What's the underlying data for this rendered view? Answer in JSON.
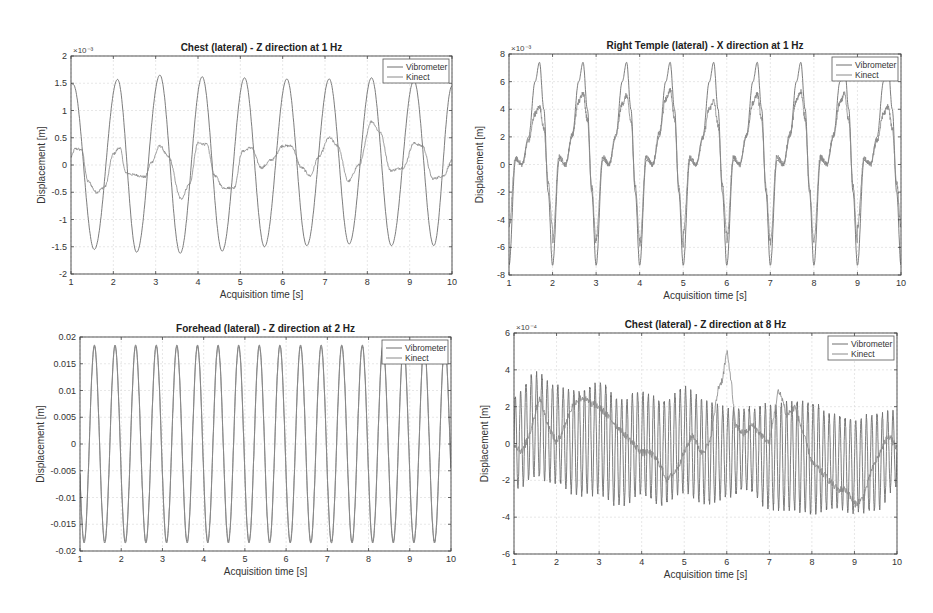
{
  "figure": {
    "background": "#ffffff",
    "axis_color": "#444444",
    "grid_color": "#d6d6d6",
    "series_colors": {
      "Vibrometer": "#6f6f6f",
      "Kinect": "#8a8a8a"
    }
  },
  "chart_data": [
    {
      "id": "chest-1hz",
      "type": "line",
      "title": "Chest (lateral) - Z direction at 1 Hz",
      "xlabel": "Acquisition time [s]",
      "ylabel": "Displacement [m]",
      "exponent_label": "×10⁻³",
      "xlim": [
        1,
        10
      ],
      "ylim": [
        -2,
        2
      ],
      "xticks": [
        "1",
        "2",
        "3",
        "4",
        "5",
        "6",
        "7",
        "8",
        "9",
        "10"
      ],
      "yticks": [
        "-2",
        "-1.5",
        "-1",
        "-0.5",
        "0",
        "0.5",
        "1",
        "1.5",
        "2"
      ],
      "ytick_values": [
        -2,
        -1.5,
        -1,
        -0.5,
        0,
        0.5,
        1,
        1.5,
        2
      ],
      "grid": true,
      "legend": {
        "position": "northeast",
        "entries": [
          "Vibrometer",
          "Kinect"
        ]
      },
      "box": {
        "left": 71,
        "top": 56,
        "right": 452,
        "bottom": 274
      },
      "series": [
        {
          "name": "Vibrometer",
          "description": "sinusoid ~1 Hz, amplitude ~1.55e-3",
          "x": [
            1.0,
            1.05,
            1.55,
            2.1,
            2.55,
            3.1,
            3.58,
            4.1,
            4.57,
            5.1,
            5.57,
            6.1,
            6.57,
            7.1,
            7.57,
            8.1,
            8.57,
            9.1,
            9.57,
            10.0
          ],
          "values": [
            1.5,
            1.48,
            -1.55,
            1.57,
            -1.6,
            1.65,
            -1.62,
            1.62,
            -1.58,
            1.6,
            -1.5,
            1.58,
            -1.48,
            1.58,
            -1.45,
            1.6,
            -1.48,
            1.55,
            -1.48,
            1.45
          ]
        },
        {
          "name": "Kinect",
          "description": "noisy low-amplitude signal ~±0.5e-3",
          "x": [
            1.0,
            1.1,
            1.25,
            1.4,
            1.6,
            1.8,
            2.0,
            2.15,
            2.3,
            2.5,
            2.75,
            2.9,
            3.1,
            3.3,
            3.6,
            3.8,
            4.0,
            4.2,
            4.4,
            4.6,
            4.85,
            5.05,
            5.25,
            5.5,
            5.75,
            6.0,
            6.2,
            6.45,
            6.65,
            6.85,
            7.1,
            7.3,
            7.55,
            7.8,
            8.1,
            8.3,
            8.55,
            8.85,
            9.1,
            9.3,
            9.55,
            9.8,
            10.0
          ],
          "values": [
            0.15,
            0.3,
            0.28,
            -0.3,
            -0.5,
            -0.4,
            0.2,
            0.32,
            -0.15,
            -0.18,
            -0.22,
            0.05,
            0.35,
            0.15,
            -0.62,
            -0.35,
            0.4,
            0.38,
            -0.2,
            -0.42,
            -0.42,
            0.25,
            0.32,
            -0.05,
            0.1,
            0.35,
            0.35,
            -0.05,
            -0.2,
            0.15,
            0.5,
            0.35,
            -0.3,
            0.0,
            0.8,
            0.6,
            -0.1,
            -0.05,
            0.4,
            0.35,
            -0.25,
            -0.2,
            0.08
          ]
        }
      ]
    },
    {
      "id": "temple-1hz",
      "type": "line",
      "title": "Right Temple (lateral) - X direction at 1 Hz",
      "xlabel": "Acquisition time [s]",
      "ylabel": "Displacement [m]",
      "exponent_label": "×10⁻³",
      "xlim": [
        1,
        10
      ],
      "ylim": [
        -8,
        8
      ],
      "xticks": [
        "1",
        "2",
        "3",
        "4",
        "5",
        "6",
        "7",
        "8",
        "9",
        "10"
      ],
      "yticks": [
        "-8",
        "-6",
        "-4",
        "-2",
        "0",
        "2",
        "4",
        "6",
        "8"
      ],
      "ytick_values": [
        -8,
        -6,
        -4,
        -2,
        0,
        2,
        4,
        6,
        8
      ],
      "grid": true,
      "legend": {
        "position": "northeast",
        "entries": [
          "Vibrometer",
          "Kinect"
        ]
      },
      "box": {
        "left": 509,
        "top": 54,
        "right": 901,
        "bottom": 275
      },
      "series": [
        {
          "name": "Vibrometer",
          "description": "periodic 1 Hz pulse, peaks ~7.5e-3, troughs ~-7.3e-3",
          "period_shape_x": [
            0.0,
            0.15,
            0.3,
            0.45,
            0.6,
            0.7,
            0.8,
            0.9,
            1.0
          ],
          "period_shape_y": [
            -7.3,
            0.3,
            0.0,
            2.0,
            6.0,
            7.4,
            4.0,
            -2.0,
            -7.3
          ],
          "cycle_starts": [
            1,
            2,
            3,
            4,
            5,
            6,
            7,
            8,
            9
          ],
          "values": [
            -7.3,
            7.4,
            -7.3,
            7.5,
            -7.3,
            7.5,
            -7.3,
            7.5,
            -7.2,
            7.5,
            -7.2,
            7.5,
            -7.2,
            7.5,
            -7.2,
            7.3,
            -7.0,
            7.0
          ]
        },
        {
          "name": "Kinect",
          "description": "tracks vibrometer with reduced amplitude, peaks ~4–5.3e-3, troughs ~-4 to -5.5e-3",
          "period_shape_x": [
            0.0,
            0.15,
            0.3,
            0.45,
            0.6,
            0.7,
            0.8,
            0.9,
            1.0
          ],
          "period_shape_y": [
            -5.2,
            0.5,
            0.0,
            2.0,
            4.2,
            4.8,
            3.0,
            -1.5,
            -5.2
          ],
          "cycle_starts": [
            1,
            2,
            3,
            4,
            5,
            6,
            7,
            8,
            9
          ],
          "values": [
            4.2,
            -5.4,
            5.2,
            -4.7,
            5.0,
            -5.3,
            5.4,
            -5.1,
            4.6,
            -5.3,
            5.1,
            -4.2,
            5.3,
            -4.5,
            5.1,
            -5.0
          ]
        }
      ]
    },
    {
      "id": "forehead-2hz",
      "type": "line",
      "title": "Forehead (lateral) - Z direction at 2 Hz",
      "xlabel": "Acquisition time [s]",
      "ylabel": "Displacement [m]",
      "exponent_label": "",
      "xlim": [
        1,
        10
      ],
      "ylim": [
        -0.02,
        0.02
      ],
      "xticks": [
        "1",
        "2",
        "3",
        "4",
        "5",
        "6",
        "7",
        "8",
        "9",
        "10"
      ],
      "yticks": [
        "-0.02",
        "-0.015",
        "-0.01",
        "-0.005",
        "0",
        "0.005",
        "0.01",
        "0.015",
        "0.02"
      ],
      "ytick_values": [
        -0.02,
        -0.015,
        -0.01,
        -0.005,
        0,
        0.005,
        0.01,
        0.015,
        0.02
      ],
      "grid": true,
      "legend": {
        "position": "northeast",
        "entries": [
          "Vibrometer",
          "Kinect"
        ]
      },
      "box": {
        "left": 80,
        "top": 337,
        "right": 451,
        "bottom": 551
      },
      "series": [
        {
          "name": "Vibrometer",
          "description": "sinusoid 2 Hz, amplitude ~0.0185; overlaps Kinect",
          "frequency_hz": 2,
          "amplitude": 0.0185,
          "phase_peak_at": 1.35
        },
        {
          "name": "Kinect",
          "description": "nearly identical to vibrometer",
          "frequency_hz": 2,
          "amplitude": 0.0182,
          "phase_peak_at": 1.35
        }
      ]
    },
    {
      "id": "chest-8hz",
      "type": "line",
      "title": "Chest (lateral) - Z direction at 8 Hz",
      "xlabel": "Acquisition time [s]",
      "ylabel": "Displacement [m]",
      "exponent_label": "×10⁻⁴",
      "xlim": [
        1,
        10
      ],
      "ylim": [
        -6,
        6
      ],
      "xticks": [
        "1",
        "2",
        "3",
        "4",
        "5",
        "6",
        "7",
        "8",
        "9",
        "10"
      ],
      "yticks": [
        "-6",
        "-4",
        "-2",
        "0",
        "2",
        "4",
        "6"
      ],
      "ytick_values": [
        -6,
        -4,
        -2,
        0,
        2,
        4,
        6
      ],
      "grid": true,
      "legend": {
        "position": "northeast",
        "entries": [
          "Vibrometer",
          "Kinect"
        ]
      },
      "box": {
        "left": 514,
        "top": 333,
        "right": 897,
        "bottom": 554
      },
      "series": [
        {
          "name": "Vibrometer",
          "description": "8 Hz oscillation amplitude ~±3e-4 with slow beating envelope",
          "frequency_hz": 8,
          "envelope_x": [
            1,
            1.5,
            2,
            2.5,
            3,
            3.5,
            4,
            4.5,
            5,
            5.5,
            6,
            6.5,
            7,
            7.5,
            8,
            8.5,
            9,
            9.5,
            10
          ],
          "envelope_center": [
            0,
            1.0,
            0.5,
            0,
            0.3,
            -0.5,
            0,
            -0.5,
            0.2,
            -0.5,
            -0.5,
            -0.3,
            -0.7,
            -0.7,
            -0.8,
            -1.0,
            -1.2,
            -1.0,
            -0.3
          ],
          "envelope_amp": [
            2.5,
            2.8,
            2.6,
            2.8,
            3.0,
            2.9,
            2.8,
            2.8,
            2.8,
            2.8,
            2.4,
            2.2,
            2.8,
            2.9,
            3.0,
            2.5,
            2.5,
            2.6,
            2.0
          ]
        },
        {
          "name": "Kinect",
          "description": "slow-drifting noisy line with spike near t=6",
          "x": [
            1,
            1.2,
            1.4,
            1.6,
            1.8,
            2.0,
            2.2,
            2.4,
            2.6,
            2.8,
            3.0,
            3.2,
            3.4,
            3.6,
            3.8,
            4.0,
            4.2,
            4.4,
            4.6,
            4.8,
            5.0,
            5.2,
            5.4,
            5.6,
            5.8,
            5.9,
            6.0,
            6.1,
            6.2,
            6.4,
            6.6,
            6.8,
            7.0,
            7.2,
            7.3,
            7.4,
            7.6,
            7.8,
            8.0,
            8.2,
            8.4,
            8.6,
            8.8,
            9.0,
            9.2,
            9.4,
            9.6,
            9.8,
            10.0
          ],
          "values": [
            0,
            -0.5,
            0.8,
            2.5,
            1.0,
            0.0,
            1.0,
            2.2,
            2.5,
            2.2,
            2.0,
            1.5,
            1.0,
            0.5,
            0.0,
            -0.5,
            -0.5,
            -1.0,
            -2.0,
            -1.5,
            -0.5,
            0.5,
            -0.5,
            0.0,
            3.0,
            3.5,
            5.0,
            3.5,
            1.0,
            0.5,
            1.0,
            0.5,
            0.0,
            2.8,
            2.5,
            1.5,
            2.0,
            0.5,
            -1.0,
            -1.5,
            -2.0,
            -2.5,
            -2.5,
            -3.3,
            -3.0,
            -1.5,
            -0.5,
            0.5,
            -0.3
          ]
        }
      ]
    }
  ]
}
